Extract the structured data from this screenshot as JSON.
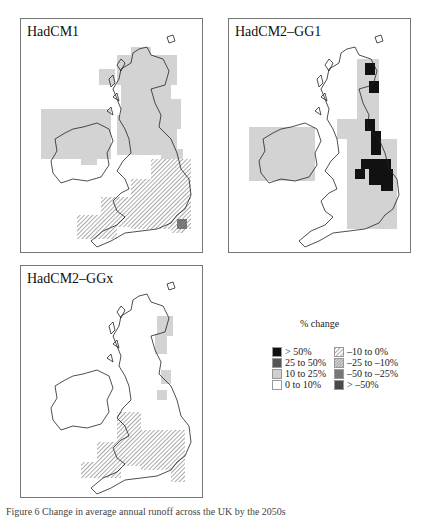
{
  "figure": {
    "caption": "Figure 6  Change in average annual runoff across the UK by the 2050s"
  },
  "panels": [
    {
      "id": "p1",
      "title": "HadCM1"
    },
    {
      "id": "p2",
      "title": "HadCM2–GG1"
    },
    {
      "id": "p3",
      "title": "HadCM2–GGx"
    }
  ],
  "legend": {
    "title": "% change",
    "positive": [
      {
        "label": "> 50%",
        "color": "#111111"
      },
      {
        "label": "25 to 50%",
        "color": "#555555"
      },
      {
        "label": "10 to 25%",
        "color": "#cfcfcf"
      },
      {
        "label": "0 to 10%",
        "color": "#ffffff"
      }
    ],
    "negative": [
      {
        "label": "–10 to 0%",
        "pattern": "light-hatch"
      },
      {
        "label": "–25 to –10%",
        "pattern": "dense-hatch"
      },
      {
        "label": "–50 to –25%",
        "pattern": "dark-hatch"
      },
      {
        "label": "> –50%",
        "pattern": "darkest-hatch"
      }
    ]
  },
  "colors": {
    "light_gray": "#d3d3d3",
    "black": "#111111",
    "coastline": "#222222",
    "hatch": "#555555"
  }
}
